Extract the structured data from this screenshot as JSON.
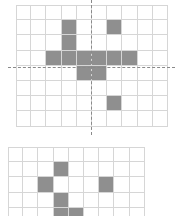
{
  "grids": [
    {
      "name": "top-grid",
      "x": 16,
      "y": 5,
      "cols": 10,
      "rows": 8,
      "cell_w": 15.2,
      "cell_h": 15.2,
      "filled_color": "#8f8f8f",
      "line_color": "#d6d6d6",
      "filled": [
        [
          1,
          3
        ],
        [
          1,
          6
        ],
        [
          2,
          3
        ],
        [
          3,
          2
        ],
        [
          3,
          3
        ],
        [
          3,
          4
        ],
        [
          3,
          5
        ],
        [
          3,
          6
        ],
        [
          3,
          7
        ],
        [
          4,
          4
        ],
        [
          4,
          5
        ],
        [
          6,
          6
        ]
      ],
      "axes": {
        "horizontal": {
          "y": 67,
          "x1": 8,
          "x2": 175
        },
        "vertical": {
          "x": 91,
          "y1": 0,
          "y2": 135
        },
        "color": "#8a8a8a"
      }
    },
    {
      "name": "bottom-grid",
      "x": 8,
      "y": 147,
      "cols": 9,
      "rows": 5,
      "cell_w": 15.2,
      "cell_h": 15.2,
      "filled_color": "#8f8f8f",
      "line_color": "#d6d6d6",
      "filled": [
        [
          1,
          3
        ],
        [
          2,
          2
        ],
        [
          2,
          6
        ],
        [
          3,
          3
        ],
        [
          4,
          3
        ],
        [
          4,
          4
        ]
      ]
    }
  ]
}
